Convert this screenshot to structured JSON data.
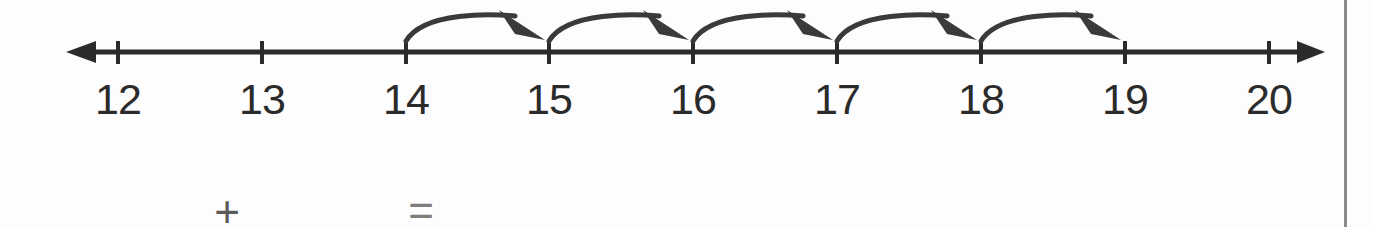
{
  "worksheet": {
    "title": "Number line hopping exercise",
    "background_color": "#fdfdfd",
    "ink_color": "#2b2b2b"
  },
  "numberline": {
    "name": "number-line",
    "axis_y": 52,
    "left_arrow_tip_x": 66,
    "right_arrow_tip_x": 1325,
    "tick_spacing_px": 144,
    "tick_top_y": 41,
    "tick_bottom_y": 64,
    "label_y": 78,
    "line_color": "#2b2b2b",
    "ticks": [
      {
        "label": "12",
        "value": 12,
        "x": 118
      },
      {
        "label": "13",
        "value": 13,
        "x": 262
      },
      {
        "label": "14",
        "value": 14,
        "x": 406
      },
      {
        "label": "15",
        "value": 15,
        "x": 549
      },
      {
        "label": "16",
        "value": 16,
        "x": 693
      },
      {
        "label": "17",
        "value": 17,
        "x": 837
      },
      {
        "label": "18",
        "value": 18,
        "x": 981
      },
      {
        "label": "19",
        "value": 19,
        "x": 1125
      },
      {
        "label": "20",
        "value": 20,
        "x": 1269
      }
    ]
  },
  "jumps": {
    "name": "hop-arcs",
    "count": 5,
    "start_value": 14,
    "end_value": 19,
    "step": 1,
    "arc_peak_y": 13,
    "arc_color": "#3a3a3a",
    "arcs": [
      {
        "from": 14,
        "to": 15,
        "from_x": 406,
        "to_x": 549
      },
      {
        "from": 15,
        "to": 16,
        "from_x": 549,
        "to_x": 693
      },
      {
        "from": 16,
        "to": 17,
        "from_x": 693,
        "to_x": 837
      },
      {
        "from": 17,
        "to": 18,
        "from_x": 837,
        "to_x": 981
      },
      {
        "from": 18,
        "to": 19,
        "from_x": 981,
        "to_x": 1125
      }
    ]
  },
  "equation": {
    "name": "equation-row",
    "first_blank": {
      "x": 120,
      "y": 212,
      "value": ""
    },
    "plus_symbol": {
      "label": "+",
      "x": 227,
      "y": 212
    },
    "second_blank": {
      "x": 320,
      "y": 212,
      "value": ""
    },
    "equals_symbol": {
      "label": "=",
      "x": 421,
      "y": 211
    },
    "answer_blank": {
      "x": 520,
      "y": 212,
      "value": ""
    }
  },
  "right_border": {
    "name": "right-border-rule",
    "x": 1344,
    "color": "#8a8a8a"
  },
  "chart_data": {
    "type": "line",
    "xlabel": "",
    "ylabel": "",
    "categories": [
      "12",
      "13",
      "14",
      "15",
      "16",
      "17",
      "18",
      "19",
      "20"
    ],
    "values": [
      12,
      13,
      14,
      15,
      16,
      17,
      18,
      19,
      20
    ],
    "xlim": [
      12,
      20
    ],
    "grid": false,
    "legend": "none",
    "annotations": [
      "hop 14 to 15",
      "hop 15 to 16",
      "hop 16 to 17",
      "hop 17 to 18",
      "hop 18 to 19"
    ]
  }
}
